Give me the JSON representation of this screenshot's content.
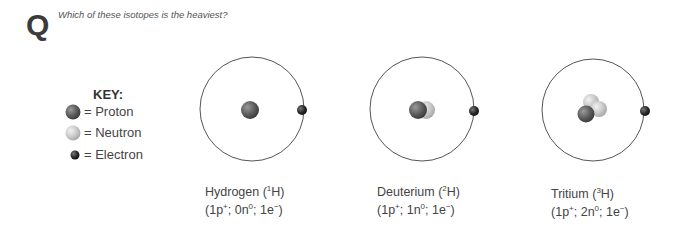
{
  "question": {
    "marker": "Q",
    "text": "Which of these isotopes is the heaviest?"
  },
  "key": {
    "title": "KEY:",
    "items": [
      {
        "symbol": "proton-sphere",
        "label": "= Proton"
      },
      {
        "symbol": "neutron-sphere",
        "label": "= Neutron"
      },
      {
        "symbol": "electron-sphere",
        "label": "= Electron"
      }
    ]
  },
  "isotopes": [
    {
      "name": "Hydrogen",
      "mass_number": "1",
      "symbol": "H",
      "protons": "1",
      "neutrons": "0",
      "electrons": "1"
    },
    {
      "name": "Deuterium",
      "mass_number": "2",
      "symbol": "H",
      "protons": "1",
      "neutrons": "1",
      "electrons": "1"
    },
    {
      "name": "Tritium",
      "mass_number": "3",
      "symbol": "H",
      "protons": "1",
      "neutrons": "2",
      "electrons": "1"
    }
  ],
  "labels": {
    "hydrogen_name": "Hydrogen (",
    "deuterium_name": "Deuterium (",
    "tritium_name": "Tritium (",
    "close_paren": "H)",
    "open_counts": "(",
    "p_unit": "p",
    "n_unit": "n",
    "e_unit": "e",
    "p_charge": "+",
    "n_charge": "0",
    "e_charge": "−",
    "sep": "; ",
    "end": ")"
  },
  "colors": {
    "proton": "#5a5a5a",
    "neutron": "#c8c8c8",
    "electron": "#2a2a2a",
    "orbit": "#555555"
  }
}
